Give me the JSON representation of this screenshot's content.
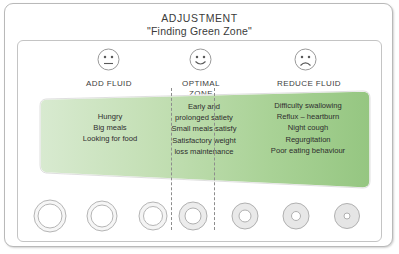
{
  "title": {
    "main": "ADJUSTMENT",
    "sub": "\"Finding Green Zone\""
  },
  "colors": {
    "zone_green_light": "#cfe6c2",
    "zone_green_mid": "#b9d9a8",
    "zone_green_dark": "#9ecb8c",
    "frame_border": "#b9b9b9",
    "panel_border": "#c4c4c4",
    "text": "#2e2e2e",
    "dash": "#8d8d8d",
    "ring_stroke": "#b5b5b5",
    "ring_fill": "#f2f2f2"
  },
  "columns": [
    {
      "key": "add-fluid",
      "face": "neutral-face",
      "label": "ADD FLUID",
      "label_line2": "",
      "items": [
        "Hungry",
        "Big meals",
        "Looking for food"
      ]
    },
    {
      "key": "optimal-zone",
      "face": "smiling-face",
      "label": "OPTIMAL",
      "label_line2": "ZONE",
      "items": [
        "Early and",
        "prolonged satiety",
        "Small meals satisfy",
        "Satisfactory weight",
        "loss maintenance"
      ]
    },
    {
      "key": "reduce-fluid",
      "face": "frowning-face",
      "label": "REDUCE FLUID",
      "label_line2": "",
      "items": [
        "Difficulty swallowing",
        "Reflux – heartburn",
        "Night cough",
        "Regurgitation",
        "Poor eating behaviour"
      ]
    }
  ],
  "rings": [
    {
      "index": 1,
      "outer_r": 16,
      "inner_r": 12,
      "shaded": false
    },
    {
      "index": 2,
      "outer_r": 15,
      "inner_r": 11,
      "shaded": false
    },
    {
      "index": 3,
      "outer_r": 14,
      "inner_r": 9.5,
      "shaded": false
    },
    {
      "index": 4,
      "outer_r": 14,
      "inner_r": 8,
      "shaded": true
    },
    {
      "index": 5,
      "outer_r": 13,
      "inner_r": 6,
      "shaded": true
    },
    {
      "index": 6,
      "outer_r": 13,
      "inner_r": 4.5,
      "shaded": true
    },
    {
      "index": 7,
      "outer_r": 12.5,
      "inner_r": 3,
      "shaded": true
    }
  ]
}
